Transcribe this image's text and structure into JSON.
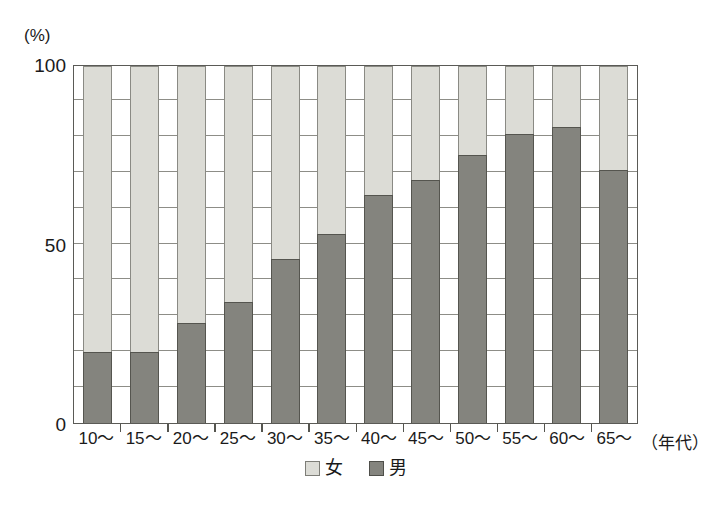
{
  "chart_data": {
    "type": "bar",
    "subtype": "stacked-100-percent",
    "title": "",
    "xlabel": "（年代）",
    "ylabel": "(%)",
    "ylim": [
      0,
      100
    ],
    "ytick_labels": [
      "0",
      "50",
      "100"
    ],
    "ytick_values": [
      0,
      50,
      100
    ],
    "gridlines": [
      10,
      20,
      30,
      40,
      50,
      60,
      70,
      80,
      90
    ],
    "grid": true,
    "legend_position": "bottom-center",
    "categories": [
      "10〜",
      "15〜",
      "20〜",
      "25〜",
      "30〜",
      "35〜",
      "40〜",
      "45〜",
      "50〜",
      "55〜",
      "60〜",
      "65〜"
    ],
    "series": [
      {
        "name": "男",
        "color": "#84847e",
        "values": [
          20,
          20,
          28,
          34,
          46,
          53,
          64,
          68,
          75,
          81,
          83,
          71
        ]
      },
      {
        "name": "女",
        "color": "#dcdcd6",
        "values": [
          80,
          80,
          72,
          66,
          54,
          47,
          36,
          32,
          25,
          19,
          17,
          29
        ]
      }
    ]
  },
  "axes": {
    "y_unit_label": "(%)",
    "x_axis_title": "（年代）"
  },
  "legend": {
    "items": [
      {
        "label": "女",
        "swatch": "light-gray-square",
        "color": "#dcdcd6"
      },
      {
        "label": "男",
        "swatch": "dark-gray-square",
        "color": "#84847e"
      }
    ]
  },
  "colors": {
    "female": "#dcdcd6",
    "male": "#84847e",
    "frame": "#5a5a56",
    "gridline": "#8d8d87",
    "background": "#ffffff",
    "text": "#1a1a1a"
  }
}
